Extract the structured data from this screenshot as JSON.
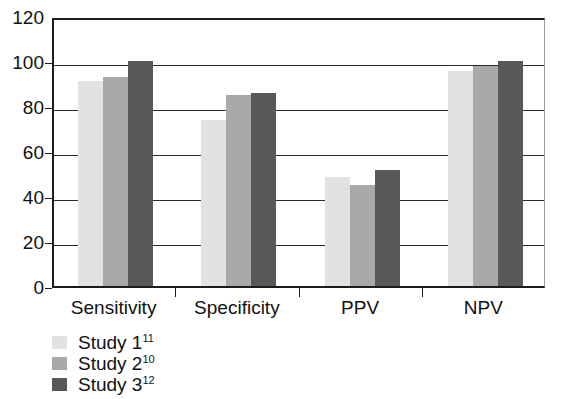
{
  "chart_data": {
    "type": "bar",
    "title": "",
    "subtitle": "",
    "xlabel": "",
    "ylabel": "",
    "ylim": [
      0,
      120
    ],
    "y_ticks": [
      0,
      20,
      40,
      60,
      80,
      100,
      120
    ],
    "grid": true,
    "grid_axis": "y",
    "legend_position": "below-left",
    "categories": [
      "Sensitivity",
      "Specificity",
      "PPV",
      "NPV"
    ],
    "series": [
      {
        "name": "Study 1",
        "reference": "11",
        "label": "Study 1",
        "color": "#e2e2e2",
        "values": [
          91,
          74,
          48.5,
          95.5
        ]
      },
      {
        "name": "Study 2",
        "reference": "10",
        "label": "Study 2",
        "color": "#a9a9a9",
        "values": [
          93,
          85,
          45,
          98
        ]
      },
      {
        "name": "Study 3",
        "reference": "12",
        "label": "Study 3",
        "color": "#585858",
        "values": [
          100,
          86,
          51.5,
          100
        ]
      }
    ]
  },
  "axis": {
    "y_tick_labels": [
      "120",
      "100",
      "80",
      "60",
      "40",
      "20",
      "0"
    ]
  },
  "legend": {
    "items": [
      {
        "label": "Study 1",
        "reference": "11",
        "color": "#e2e2e2"
      },
      {
        "label": "Study 2",
        "reference": "10",
        "color": "#a9a9a9"
      },
      {
        "label": "Study 3",
        "reference": "12",
        "color": "#585858"
      }
    ]
  },
  "colors": {
    "series_1": "#e2e2e2",
    "series_2": "#a9a9a9",
    "series_3": "#585858",
    "axis": "#1c1c1c",
    "grid": "#2a2a2a",
    "background": "#ffffff"
  }
}
